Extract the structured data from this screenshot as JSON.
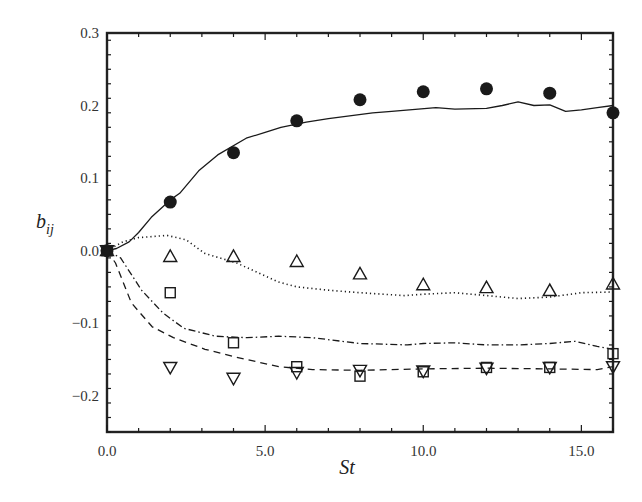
{
  "chart_data": {
    "type": "line",
    "title": "",
    "xlabel": "St",
    "ylabel": "b_ij",
    "ylabel_main": "b",
    "ylabel_sub": "ij",
    "xlim": [
      0,
      16
    ],
    "ylim": [
      -0.25,
      0.3
    ],
    "grid": false,
    "legend": "none",
    "x_ticks": [
      0,
      5,
      10,
      15
    ],
    "x_tick_labels": [
      "0.0",
      "5.0",
      "10.0",
      "15.0"
    ],
    "y_ticks": [
      -0.2,
      -0.1,
      0.0,
      0.1,
      0.2,
      0.3
    ],
    "y_tick_labels": [
      "−0.2",
      "−0.1",
      "0.0",
      "0.1",
      "0.2",
      "0.3"
    ],
    "lines": [
      {
        "name": "solid",
        "style": "solid",
        "x": [
          0,
          0.3,
          0.7,
          1.0,
          1.4,
          2.0,
          2.3,
          2.9,
          3.5,
          4.4,
          5.0,
          5.5,
          6.3,
          7.0,
          8.4,
          9.0,
          10.4,
          11.0,
          12.0,
          12.5,
          13.0,
          13.5,
          14.0,
          14.5,
          15.0,
          15.5,
          16.0
        ],
        "y": [
          0,
          0.003,
          0.012,
          0.025,
          0.046,
          0.07,
          0.079,
          0.11,
          0.132,
          0.155,
          0.163,
          0.17,
          0.177,
          0.182,
          0.19,
          0.192,
          0.197,
          0.195,
          0.196,
          0.2,
          0.205,
          0.2,
          0.201,
          0.192,
          0.194,
          0.197,
          0.2
        ]
      },
      {
        "name": "dotted",
        "style": "dotted",
        "x": [
          0,
          0.5,
          1.0,
          1.9,
          2.5,
          3.1,
          4.1,
          5.4,
          6.0,
          7.1,
          8.0,
          9.4,
          10.0,
          11.0,
          12.0,
          13.0,
          14.0,
          15.0,
          16.0
        ],
        "y": [
          0,
          0.012,
          0.018,
          0.021,
          0.015,
          -0.004,
          -0.017,
          -0.043,
          -0.05,
          -0.055,
          -0.058,
          -0.062,
          -0.06,
          -0.058,
          -0.062,
          -0.066,
          -0.064,
          -0.058,
          -0.057
        ]
      },
      {
        "name": "dash-dot",
        "style": "dashdot",
        "x": [
          0,
          0.43,
          1.1,
          1.77,
          2.43,
          3.43,
          4.43,
          5.43,
          6.5,
          8.0,
          9.5,
          10.0,
          11.0,
          12.0,
          13.0,
          14.0,
          14.8,
          15.5,
          16.0
        ],
        "y": [
          0,
          -0.01,
          -0.055,
          -0.086,
          -0.107,
          -0.118,
          -0.12,
          -0.118,
          -0.12,
          -0.128,
          -0.13,
          -0.128,
          -0.127,
          -0.13,
          -0.13,
          -0.128,
          -0.125,
          -0.132,
          -0.136
        ]
      },
      {
        "name": "dashed",
        "style": "dashed",
        "x": [
          0,
          0.27,
          0.77,
          1.43,
          2.1,
          3.1,
          4.1,
          5.43,
          6.5,
          8.0,
          10.0,
          12.0,
          14.0,
          15.5,
          16.0
        ],
        "y": [
          0,
          -0.017,
          -0.072,
          -0.105,
          -0.12,
          -0.136,
          -0.147,
          -0.16,
          -0.164,
          -0.165,
          -0.163,
          -0.162,
          -0.163,
          -0.164,
          -0.16
        ]
      }
    ],
    "series": [
      {
        "name": "filled-circle",
        "marker": "filled-circle",
        "x": [
          0,
          2,
          4,
          6,
          8,
          10,
          12,
          14,
          16
        ],
        "y": [
          0,
          0.067,
          0.135,
          0.179,
          0.208,
          0.219,
          0.223,
          0.217,
          0.19
        ]
      },
      {
        "name": "triangle-up",
        "marker": "triangle-up",
        "x": [
          0,
          2,
          4,
          6,
          8,
          10,
          12,
          14,
          16
        ],
        "y": [
          0,
          -0.008,
          -0.008,
          -0.015,
          -0.032,
          -0.047,
          -0.051,
          -0.055,
          -0.046
        ]
      },
      {
        "name": "square",
        "marker": "square",
        "x": [
          0,
          2,
          4,
          6,
          8,
          10,
          12,
          14,
          16
        ],
        "y": [
          0,
          -0.058,
          -0.127,
          -0.16,
          -0.173,
          -0.167,
          -0.161,
          -0.161,
          -0.142
        ]
      },
      {
        "name": "triangle-down",
        "marker": "triangle-down",
        "x": [
          0,
          2,
          4,
          6,
          8,
          10,
          12,
          14,
          16
        ],
        "y": [
          0,
          -0.161,
          -0.176,
          -0.168,
          -0.165,
          -0.166,
          -0.162,
          -0.161,
          -0.16
        ]
      }
    ],
    "colors": {
      "ink": "#1a1a1a",
      "frame": "#222222",
      "background": "#ffffff"
    }
  }
}
